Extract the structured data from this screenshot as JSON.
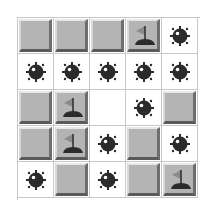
{
  "game": {
    "title": "Minesweeper",
    "rows": 5,
    "cols": 5,
    "colors": {
      "covered": "#b4b4b4",
      "revealed": "#ffffff",
      "mine": "#2b2b2b",
      "flag": "#8a8a8a",
      "flag_base": "#2b2b2b"
    },
    "board": [
      [
        "covered",
        "covered",
        "covered",
        "flag",
        "mine"
      ],
      [
        "mine",
        "mine",
        "mine",
        "mine",
        "mine"
      ],
      [
        "covered",
        "flag",
        "empty",
        "mine",
        "covered"
      ],
      [
        "covered",
        "flag",
        "mine",
        "covered",
        "mine"
      ],
      [
        "mine",
        "covered",
        "mine",
        "covered",
        "flag"
      ]
    ]
  }
}
